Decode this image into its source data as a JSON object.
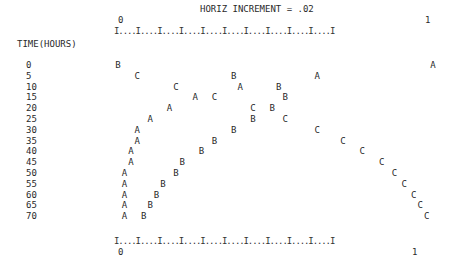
{
  "chart_data": {
    "type": "scatter",
    "title": "HORIZ INCREMENT = .02",
    "ylabel": "TIME(HOURS)",
    "xlabel": "",
    "xlim": [
      0,
      1
    ],
    "x_tick_labels": [
      "0",
      "1"
    ],
    "axis_line": "I....I....I....I....I....I....I....I....I....I....I",
    "categories": [
      0,
      5,
      10,
      15,
      20,
      25,
      30,
      35,
      40,
      45,
      50,
      55,
      60,
      65,
      70
    ],
    "series": [
      {
        "name": "A",
        "values": [
          0.98,
          0.62,
          0.38,
          0.24,
          0.16,
          0.1,
          0.06,
          0.06,
          0.04,
          0.04,
          0.02,
          0.02,
          0.02,
          0.02,
          0.02
        ]
      },
      {
        "name": "B",
        "values": [
          0.0,
          0.36,
          0.5,
          0.52,
          0.48,
          0.42,
          0.36,
          0.3,
          0.26,
          0.2,
          0.18,
          0.14,
          0.12,
          0.1,
          0.08
        ]
      },
      {
        "name": "C",
        "values": [
          null,
          0.06,
          0.18,
          0.3,
          0.42,
          0.52,
          0.62,
          0.7,
          0.76,
          0.82,
          0.86,
          0.89,
          0.92,
          0.94,
          0.96
        ]
      }
    ]
  },
  "header": {
    "title": "HORIZ INCREMENT = .02",
    "tick_zero": "0",
    "tick_one": "1",
    "axis_line": "I....I....I....I....I....I....I....I....I....I....I"
  },
  "yaxis": {
    "label": "TIME(HOURS)",
    "ticks": [
      "0",
      "5",
      "10",
      "15",
      "20",
      "25",
      "30",
      "35",
      "40",
      "45",
      "50",
      "55",
      "60",
      "65",
      "70"
    ]
  },
  "footer": {
    "axis_line": "I....I....I....I....I....I....I....I....I....I....I",
    "tick_zero": "0",
    "tick_one": "1"
  },
  "markers": {
    "a": "A",
    "b": "B",
    "c": "C"
  }
}
